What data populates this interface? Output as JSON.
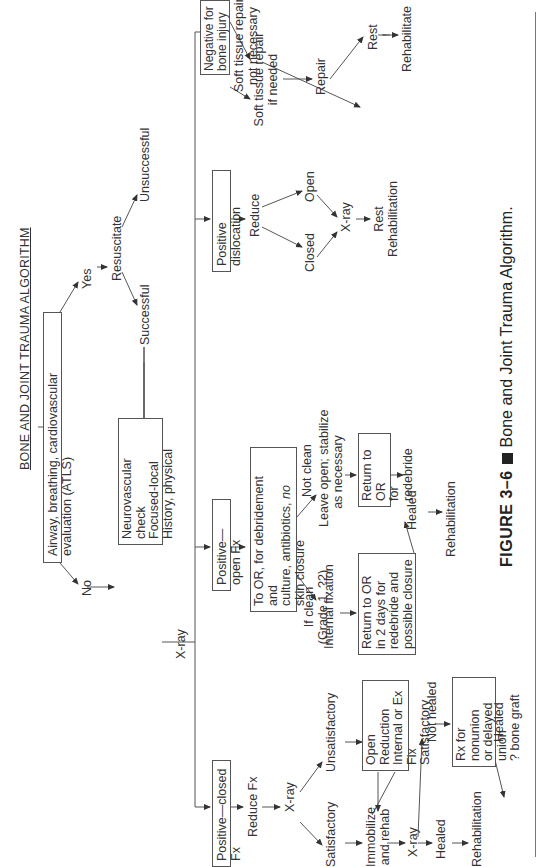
{
  "figure": {
    "title": "BONE AND JOINT TRAUMA ALGORITHM",
    "caption_label": "FIGURE 3–6",
    "caption_text": "Bone and Joint Trauma Algorithm."
  },
  "nodes": {
    "airway": "Airway, breathing, cardiovascular evaluation (ATLS)",
    "yes": "Yes",
    "no": "No",
    "resuscitate": "Resuscitate",
    "successful": "Successful",
    "unsuccessful": "Unsuccessful",
    "history": [
      "History, physical",
      "Focused-local",
      "Neurovascular check"
    ],
    "xray_main": "X-ray",
    "closed_fx": "Positive—closed Fx",
    "reduce_fx": "Reduce Fx",
    "xray_closed": "X-ray",
    "satisfactory": "Satisfactory",
    "unsatisfactory": "Unsatisfactory",
    "immobilize": [
      "Immobilize",
      "and rehab"
    ],
    "open_reduction": [
      "Open Reduction",
      "Internal or Ex Fix",
      "Satisfactory"
    ],
    "xray_immob": "X-ray",
    "healed_closed": "Healed",
    "not_healed": "Not healed",
    "rx_nonunion": [
      "Rx for nonunion",
      "or delayed union",
      "? bone graft"
    ],
    "healed_rx": "Healed",
    "rehab_closed": "Rehabilitation",
    "open_fx": "Positive—open Fx",
    "to_or": [
      "To OR, for debridement and",
      "culture, antibiotics, no",
      "skin closure"
    ],
    "to_or_italic_word": "no",
    "if_clean": [
      "If clean",
      "(Grade 1, ?2)"
    ],
    "not_clean": "Not clean",
    "internal_fixation": "Internal fixation",
    "leave_open": [
      "Leave open; stabilize",
      "as necessary"
    ],
    "return_2days": [
      "Return to OR",
      "in 2 days for",
      "redebride and",
      "possible closure"
    ],
    "return_redebride": [
      "Return to OR",
      "for redebride"
    ],
    "healed_open": "Healed",
    "rehab_open": "Rehabilitation",
    "dislocation": "Positive dislocation",
    "reduce": "Reduce",
    "closed": "Closed",
    "open": "Open",
    "xray_disl": "X-ray",
    "rest_disl": [
      "Rest",
      "Rehabilitation"
    ],
    "negative": "Negative for bone injury",
    "soft_needed": [
      "Soft tissue repair",
      "if needed"
    ],
    "soft_not_needed": [
      "Soft tissue repair",
      "not necessary"
    ],
    "repair": "Repair",
    "rest": "Rest",
    "rehabilitate": "Rehabilitate"
  },
  "colors": {
    "line": "#555555",
    "text": "#333333",
    "background": "#ffffff"
  }
}
